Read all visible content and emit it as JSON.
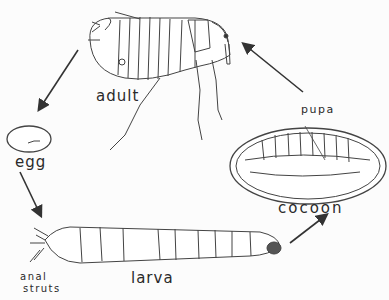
{
  "labels": {
    "adult": "adult",
    "egg": "egg",
    "larva": "larva",
    "anal_struts_1": "anal",
    "anal_struts_2": "struts",
    "pupa": "pupa",
    "cocoon": "cocoon"
  },
  "stages_order": [
    "adult",
    "egg",
    "larva",
    "cocoon"
  ],
  "colors": {
    "line": "#3a3a3a",
    "background": "#fcfcfc"
  }
}
